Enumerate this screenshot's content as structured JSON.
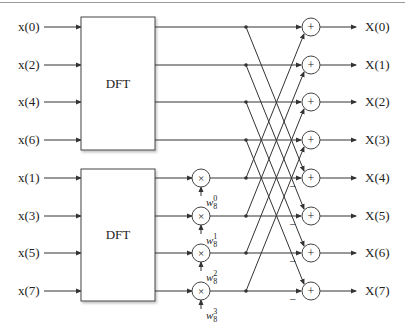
{
  "diagram": {
    "type": "radix-2 decimation-in-time FFT butterfly (8-point)",
    "blocks": [
      {
        "label": "DFT",
        "inputs": [
          "x(0)",
          "x(2)",
          "x(4)",
          "x(6)"
        ]
      },
      {
        "label": "DFT",
        "inputs": [
          "x(1)",
          "x(3)",
          "x(5)",
          "x(7)"
        ]
      }
    ],
    "inputs_top": [
      "x(0)",
      "x(2)",
      "x(4)",
      "x(6)"
    ],
    "inputs_bottom": [
      "x(1)",
      "x(3)",
      "x(5)",
      "x(7)"
    ],
    "block_label": "DFT",
    "multiplier_symbol": "×",
    "adder_symbol": "+",
    "minus_symbol": "–",
    "twiddles": [
      {
        "base": "w",
        "sub": "8",
        "sup": "0"
      },
      {
        "base": "w",
        "sub": "8",
        "sup": "1"
      },
      {
        "base": "w",
        "sub": "8",
        "sup": "2"
      },
      {
        "base": "w",
        "sub": "8",
        "sup": "3"
      }
    ],
    "outputs": [
      "X(0)",
      "X(1)",
      "X(2)",
      "X(3)",
      "X(4)",
      "X(5)",
      "X(6)",
      "X(7)"
    ]
  },
  "colors": {
    "stroke": "#333333",
    "text": "#222222",
    "background": "#ffffff"
  }
}
